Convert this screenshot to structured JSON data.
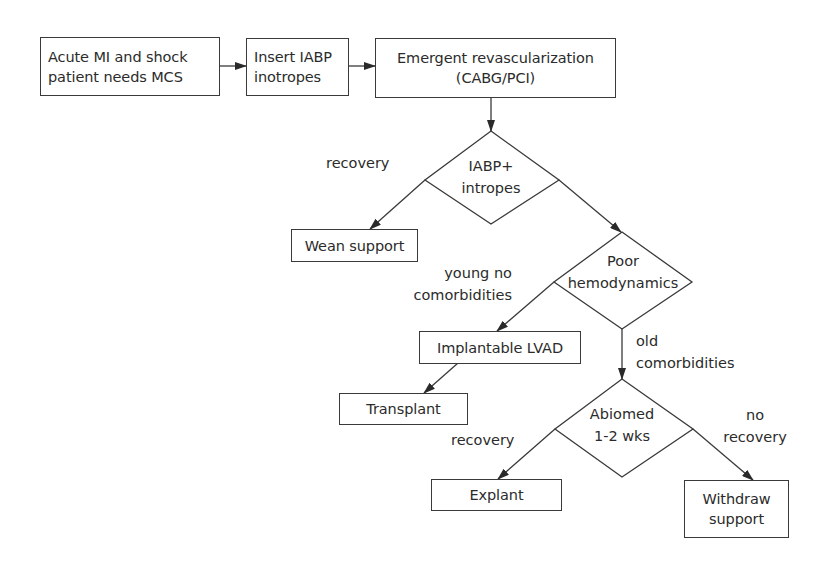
{
  "diagram": {
    "type": "flowchart",
    "nodes": {
      "start": {
        "lines": [
          "Acute MI and shock",
          "patient needs MCS"
        ]
      },
      "insert_iabp": {
        "lines": [
          "Insert IABP",
          "inotropes"
        ]
      },
      "revascularization": {
        "lines": [
          "Emergent revascularization",
          "(CABG/PCI)"
        ]
      },
      "decision_iabp": {
        "lines": [
          "IABP+",
          "intropes"
        ]
      },
      "wean_support": {
        "lines": [
          "Wean support"
        ]
      },
      "decision_hemodynamics": {
        "lines": [
          "Poor",
          "hemodynamics"
        ]
      },
      "implantable_lvad": {
        "lines": [
          "Implantable LVAD"
        ]
      },
      "transplant": {
        "lines": [
          "Transplant"
        ]
      },
      "decision_abiomed": {
        "lines": [
          "Abiomed",
          "1-2 wks"
        ]
      },
      "explant": {
        "lines": [
          "Explant"
        ]
      },
      "withdraw_support": {
        "lines": [
          "Withdraw",
          "support"
        ]
      }
    },
    "edge_labels": {
      "iabp_recovery": {
        "lines": [
          "recovery"
        ]
      },
      "young": {
        "lines": [
          "young no",
          "comorbidities"
        ]
      },
      "old": {
        "lines": [
          "old",
          "comorbidities"
        ]
      },
      "abiomed_recovery": {
        "lines": [
          "recovery"
        ]
      },
      "no_recovery": {
        "lines": [
          "no",
          "recovery"
        ]
      }
    },
    "edges": [
      {
        "from": "start",
        "to": "insert_iabp",
        "label": ""
      },
      {
        "from": "insert_iabp",
        "to": "revascularization",
        "label": ""
      },
      {
        "from": "revascularization",
        "to": "decision_iabp",
        "label": ""
      },
      {
        "from": "decision_iabp",
        "to": "wean_support",
        "label": "recovery"
      },
      {
        "from": "decision_iabp",
        "to": "decision_hemodynamics",
        "label": ""
      },
      {
        "from": "decision_hemodynamics",
        "to": "implantable_lvad",
        "label": "young no comorbidities"
      },
      {
        "from": "implantable_lvad",
        "to": "transplant",
        "label": ""
      },
      {
        "from": "decision_hemodynamics",
        "to": "decision_abiomed",
        "label": "old comorbidities"
      },
      {
        "from": "decision_abiomed",
        "to": "explant",
        "label": "recovery"
      },
      {
        "from": "decision_abiomed",
        "to": "withdraw_support",
        "label": "no recovery"
      }
    ],
    "colors": {
      "line": "#3a3a3a",
      "text": "#2b2b2b",
      "background": "#ffffff"
    }
  }
}
